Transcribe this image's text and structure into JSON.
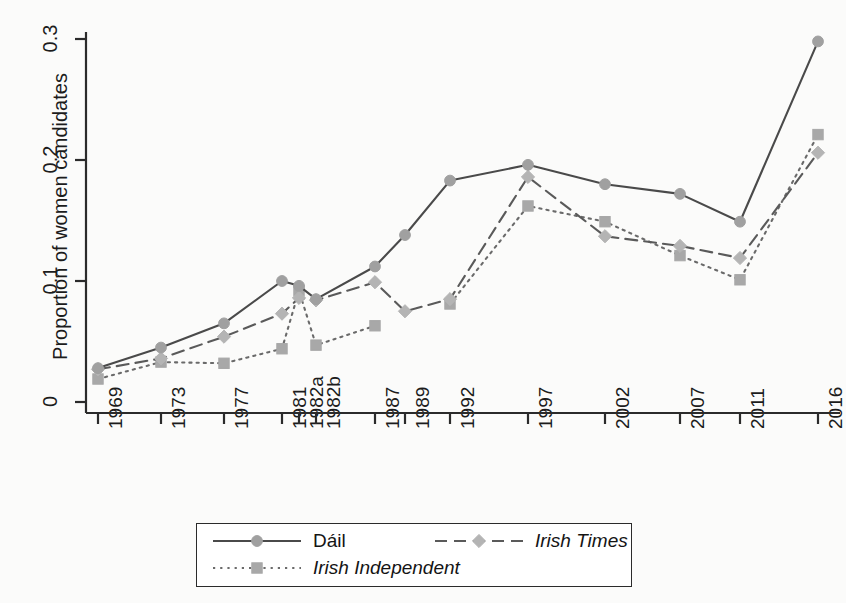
{
  "chart_data": {
    "type": "line",
    "title": "",
    "xlabel": "",
    "ylabel": "Proportion of women candidates",
    "categories": [
      "1969",
      "1973",
      "1977",
      "1981",
      "1982a",
      "1982b",
      "1987",
      "1989",
      "1992",
      "1997",
      "2002",
      "2007",
      "2011",
      "2016"
    ],
    "ylim": [
      0,
      0.3
    ],
    "yticks": [
      "0",
      "0.1",
      "0.2",
      "0.3"
    ],
    "ytick_values": [
      0,
      0.1,
      0.2,
      0.3
    ],
    "grid": false,
    "legend_position": "bottom-center",
    "series": [
      {
        "name": "Dáil",
        "style": "solid",
        "marker": "circle",
        "color": "#4a4a4a",
        "marker_color": "#a0a0a0",
        "values": [
          0.028,
          0.045,
          0.065,
          0.1,
          0.096,
          0.085,
          0.112,
          0.138,
          0.183,
          0.196,
          0.18,
          0.172,
          0.149,
          0.298
        ]
      },
      {
        "name": "Irish Independent",
        "style": "dotted",
        "marker": "square",
        "color": "#6a6a6a",
        "marker_color": "#a8a8a8",
        "italic": true,
        "values": [
          0.019,
          0.033,
          0.032,
          0.044,
          0.092,
          0.047,
          0.063,
          null,
          0.081,
          0.162,
          0.149,
          0.121,
          0.101,
          0.221
        ]
      },
      {
        "name": "Irish Times",
        "style": "dashed",
        "marker": "diamond",
        "color": "#5a5a5a",
        "marker_color": "#b4b4b4",
        "italic": true,
        "values": [
          0.027,
          0.036,
          0.054,
          0.073,
          0.086,
          0.084,
          0.099,
          0.075,
          0.085,
          0.186,
          0.137,
          0.129,
          0.119,
          0.206
        ]
      }
    ]
  },
  "axes": {
    "y_label": "Proportion of women candidates",
    "y_ticks": [
      "0",
      "0.1",
      "0.2",
      "0.3"
    ],
    "x_ticks": [
      "1969",
      "1973",
      "1977",
      "1981",
      "1982a",
      "1982b",
      "1987",
      "1989",
      "1992",
      "1997",
      "2002",
      "2007",
      "2011",
      "2016"
    ]
  },
  "legend": {
    "items": [
      {
        "label": "Dáil",
        "style": "solid",
        "marker": "circle",
        "italic": false
      },
      {
        "label": "Irish Times",
        "style": "dashed",
        "marker": "diamond",
        "italic": true
      },
      {
        "label": "Irish Independent",
        "style": "dotted",
        "marker": "square",
        "italic": true
      }
    ]
  },
  "colors": {
    "axis": "#2b2b2b",
    "line_dark": "#4a4a4a",
    "marker": "#a8a8a8",
    "background": "#fbfbfa"
  }
}
